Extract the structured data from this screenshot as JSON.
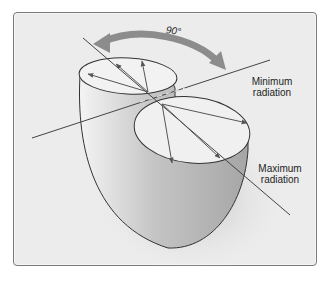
{
  "figure": {
    "angle_label": "90°",
    "labels": {
      "minimum": {
        "line1": "Minimum",
        "line2": "radiation"
      },
      "maximum": {
        "line1": "Maximum",
        "line2": "radiation"
      }
    }
  }
}
